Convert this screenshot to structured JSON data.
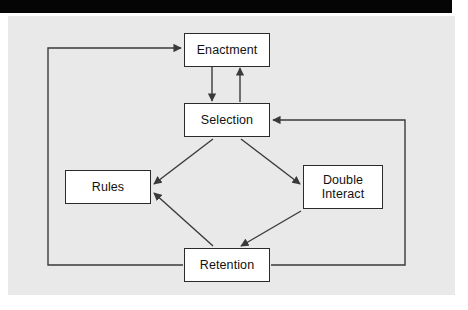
{
  "window": {
    "title_bar": ""
  },
  "diagram": {
    "title": "",
    "background_color": "#e9e9e9",
    "line_color": "#3a3a3a",
    "node_fill": "#ffffff",
    "node_border": "#2b2b2b",
    "nodes": [
      {
        "id": "enactment",
        "label": "Enactment"
      },
      {
        "id": "selection",
        "label": "Selection"
      },
      {
        "id": "rules",
        "label": "Rules"
      },
      {
        "id": "double_interact",
        "label_line1": "Double",
        "label_line2": "Interact"
      },
      {
        "id": "retention",
        "label": "Retention"
      }
    ],
    "edges": [
      {
        "from": "enactment",
        "to": "selection",
        "type": "vertical-down"
      },
      {
        "from": "selection",
        "to": "enactment",
        "type": "vertical-up"
      },
      {
        "from": "selection",
        "to": "rules",
        "type": "diagonal"
      },
      {
        "from": "selection",
        "to": "double_interact",
        "type": "diagonal"
      },
      {
        "from": "double_interact",
        "to": "retention",
        "type": "diagonal"
      },
      {
        "from": "retention",
        "to": "rules",
        "type": "diagonal"
      },
      {
        "from": "retention",
        "to": "enactment",
        "type": "feedback-left-loop"
      },
      {
        "from": "retention",
        "to": "selection",
        "type": "feedback-right-loop"
      }
    ]
  }
}
